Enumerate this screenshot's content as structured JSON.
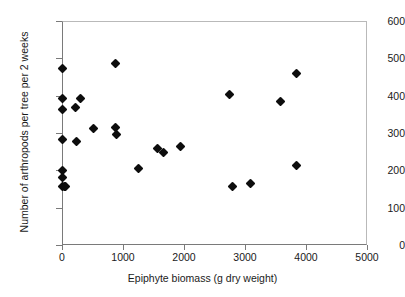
{
  "chart_data": {
    "type": "scatter",
    "title": "",
    "xlabel": "Epiphyte biomass (g dry weight)",
    "ylabel": "Number of arthropods per tree per 2 weeks",
    "xlim": [
      0,
      5000
    ],
    "ylim": [
      0,
      600
    ],
    "xticks": [
      0,
      1000,
      2000,
      3000,
      4000,
      5000
    ],
    "yticks": [
      0,
      100,
      200,
      300,
      400,
      500,
      600
    ],
    "grid": false,
    "legend": null,
    "marker": "filled-diamond",
    "marker_color": "#0d0d0d",
    "series": [
      {
        "name": "Arthropods vs epiphyte biomass",
        "points": [
          [
            10,
            472
          ],
          [
            10,
            393
          ],
          [
            10,
            362
          ],
          [
            10,
            283
          ],
          [
            10,
            200
          ],
          [
            10,
            180
          ],
          [
            15,
            157
          ],
          [
            40,
            156
          ],
          [
            60,
            156
          ],
          [
            225,
            368
          ],
          [
            235,
            278
          ],
          [
            300,
            393
          ],
          [
            510,
            313
          ],
          [
            870,
            485
          ],
          [
            880,
            314
          ],
          [
            890,
            295
          ],
          [
            1250,
            204
          ],
          [
            1570,
            259
          ],
          [
            1665,
            249
          ],
          [
            1950,
            263
          ],
          [
            2740,
            404
          ],
          [
            2800,
            156
          ],
          [
            3090,
            165
          ],
          [
            3590,
            384
          ],
          [
            3840,
            460
          ],
          [
            3845,
            212
          ]
        ]
      }
    ]
  },
  "axes": {
    "x_tick_labels": [
      "0",
      "1000",
      "2000",
      "3000",
      "4000",
      "5000"
    ],
    "y_tick_labels": [
      "0",
      "100",
      "200",
      "300",
      "400",
      "500",
      "600"
    ]
  }
}
